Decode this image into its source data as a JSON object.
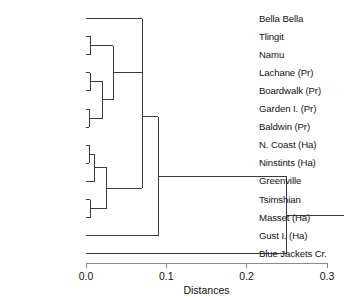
{
  "chart_data": {
    "type": "dendrogram",
    "title": "",
    "xlabel": "Distances",
    "ylabel": "",
    "xlim": [
      0.0,
      0.3
    ],
    "xticks": [
      0.0,
      0.1,
      0.2,
      0.3
    ],
    "xtick_labels": [
      "0.0",
      "0.1",
      "0.2",
      "0.3"
    ],
    "grid": false,
    "legend": "none",
    "orientation": "horizontal-left-labels",
    "leaves": [
      "Bella Bella",
      "Tlingit",
      "Namu",
      "Lachane (Pr)",
      "Boardwalk (Pr)",
      "Garden I. (Pr)",
      "Baldwin (Pr)",
      "N. Coast (Ha)",
      "Ninstints (Ha)",
      "Greenville",
      "Tsimshian",
      "Masset (Ha)",
      "Gust I. (Ha)",
      "Blue Jackets Cr."
    ],
    "merges": [
      {
        "id": "m1",
        "label": "Tlingit + Namu",
        "members": [
          "Tlingit",
          "Namu"
        ],
        "distance": 0.006
      },
      {
        "id": "m2",
        "label": "Lachane + Boardwalk",
        "members": [
          "Lachane (Pr)",
          "Boardwalk (Pr)"
        ],
        "distance": 0.005
      },
      {
        "id": "m3",
        "label": "Garden I. + Baldwin",
        "members": [
          "Garden I. (Pr)",
          "Baldwin (Pr)"
        ],
        "distance": 0.004
      },
      {
        "id": "m4",
        "label": "Prince Rupert group",
        "members": [
          "m2",
          "m3"
        ],
        "distance": 0.021
      },
      {
        "id": "m5",
        "label": "Tlingit/Namu + Prince Rupert",
        "members": [
          "m1",
          "m4"
        ],
        "distance": 0.034
      },
      {
        "id": "m6",
        "label": "Bella Bella + northern group",
        "members": [
          "Bella Bella",
          "m5"
        ],
        "distance": 0.07
      },
      {
        "id": "m7",
        "label": "N. Coast + Ninstints",
        "members": [
          "N. Coast (Ha)",
          "Ninstints (Ha)"
        ],
        "distance": 0.004
      },
      {
        "id": "m8",
        "label": "N. Coast/Ninstints + Greenville",
        "members": [
          "m7",
          "Greenville"
        ],
        "distance": 0.011
      },
      {
        "id": "m9",
        "label": "Tsimshian + Masset",
        "members": [
          "Tsimshian",
          "Masset (Ha)"
        ],
        "distance": 0.005
      },
      {
        "id": "m10",
        "label": "Haida/Tsimshian group",
        "members": [
          "m8",
          "m9"
        ],
        "distance": 0.026
      },
      {
        "id": "m11",
        "label": "Upper clade",
        "members": [
          "m6",
          "m10"
        ],
        "distance": 0.07
      },
      {
        "id": "m12",
        "label": "Upper clade + Gust I.",
        "members": [
          "m11",
          "Gust I. (Ha)"
        ],
        "distance": 0.09
      },
      {
        "id": "m13",
        "label": "Root: all + Blue Jackets Cr.",
        "members": [
          "m12",
          "Blue Jackets Cr."
        ],
        "distance": 0.25
      }
    ]
  },
  "axis": {
    "title": "Distances",
    "ticks": [
      {
        "value": "0.0"
      },
      {
        "value": "0.1"
      },
      {
        "value": "0.2"
      },
      {
        "value": "0.3"
      }
    ]
  },
  "leaf_labels": [
    {
      "text": "Bella Bella"
    },
    {
      "text": "Tlingit"
    },
    {
      "text": "Namu"
    },
    {
      "text": "Lachane (Pr)"
    },
    {
      "text": "Boardwalk (Pr)"
    },
    {
      "text": "Garden I. (Pr)"
    },
    {
      "text": "Baldwin (Pr)"
    },
    {
      "text": "N. Coast (Ha)"
    },
    {
      "text": "Ninstints (Ha)"
    },
    {
      "text": "Greenville"
    },
    {
      "text": "Tsimshian"
    },
    {
      "text": "Masset (Ha)"
    },
    {
      "text": "Gust I. (Ha)"
    },
    {
      "text": "Blue Jackets Cr."
    }
  ],
  "title": {
    "text": ""
  }
}
